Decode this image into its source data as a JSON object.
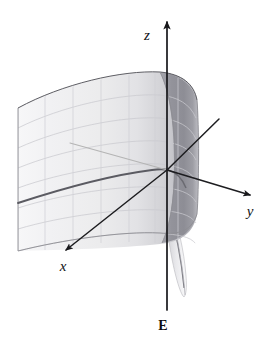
{
  "figure": {
    "background_color": "#ffffff",
    "surface_label": "E",
    "axes": [
      {
        "name": "x",
        "label": "x",
        "label_x": 63,
        "label_y": 271,
        "direction": "down-left-front"
      },
      {
        "name": "y",
        "label": "y",
        "label_x": 250,
        "label_y": 216,
        "direction": "right-down"
      },
      {
        "name": "z",
        "label": "z",
        "label_x": 147,
        "label_y": 40,
        "direction": "up"
      }
    ],
    "origin": {
      "x": 167,
      "y": 170
    },
    "geometry": {
      "z_axis": {
        "x": 167,
        "y_top": 18,
        "y_bottom": 310,
        "arrow": "up"
      },
      "y_axis": {
        "x1": 167,
        "y1": 170,
        "x2": 253,
        "y2": 196,
        "arrow": "end"
      },
      "x_axis": {
        "x1": 167,
        "y1": 170,
        "x2": 62,
        "y2": 253,
        "arrow": "end"
      },
      "x_axis_back": {
        "x1": 167,
        "y1": 170,
        "x2": 219,
        "y2": 119,
        "arrow": "none"
      },
      "x_axis_hidden": {
        "x1": 167,
        "y1": 170,
        "x2": 70,
        "y2": 143
      },
      "surface_left_edge": {
        "x": 18,
        "y_top": 108,
        "y_bottom": 251
      },
      "surface_bottom_dark_curve": {
        "from_x": 18,
        "from_y": 202,
        "to_x": 167,
        "to_y": 170
      }
    },
    "colors": {
      "axis": "#17171a",
      "grid": "#c9c9cf",
      "surface_light": "#f2f2f4",
      "surface_mid": "#d6d6da",
      "surface_dark": "#8e8e95",
      "curve_dark": "#5b5b62",
      "label": "#121215"
    },
    "grid": {
      "horizontal_lines": 8,
      "vertical_lines": 6,
      "visible": true
    }
  }
}
